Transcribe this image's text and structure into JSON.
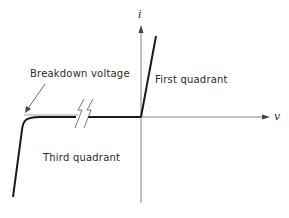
{
  "diagram": {
    "type": "diode I-V characteristic",
    "axes": {
      "x_label": "v",
      "y_label": "i"
    },
    "labels": {
      "breakdown": "Breakdown voltage",
      "first_quadrant": "First quadrant",
      "third_quadrant": "Third quadrant"
    },
    "colors": {
      "curve": "#1a1a1a",
      "axis": "#555555",
      "background": "#ffffff"
    }
  }
}
